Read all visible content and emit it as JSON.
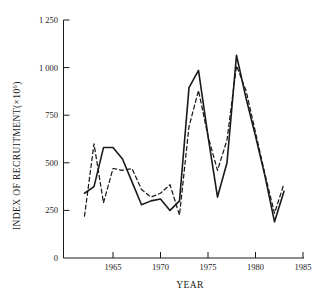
{
  "chart_data": {
    "type": "line",
    "title": "",
    "xlabel": "YEAR",
    "ylabel": "INDEX OF RECRUITMENT(×10",
    "ylabel_sup": "6",
    "ylabel_close": ")",
    "xlim": [
      1961.5,
      1985.0
    ],
    "ylim": [
      0,
      1250
    ],
    "xticks": [
      1965,
      1970,
      1975,
      1980,
      1985
    ],
    "xtick_labels": [
      "1965",
      "1970",
      "1975",
      "1980",
      "1985"
    ],
    "yticks": [
      0,
      250,
      500,
      750,
      1000,
      1250
    ],
    "ytick_labels": [
      "0",
      "250",
      "500",
      "750",
      "1 000",
      "1 250"
    ],
    "grid": false,
    "legend": "none",
    "series": [
      {
        "name": "solid-series",
        "style": "solid",
        "color": "#1a1a1a",
        "x": [
          1962,
          1963,
          1964,
          1965,
          1966,
          1967,
          1968,
          1969,
          1970,
          1971,
          1972,
          1973,
          1974,
          1975,
          1976,
          1977,
          1978,
          1979,
          1980,
          1981,
          1982,
          1983
        ],
        "values": [
          340,
          375,
          580,
          580,
          520,
          400,
          280,
          300,
          310,
          250,
          300,
          895,
          985,
          640,
          320,
          500,
          1065,
          840,
          640,
          430,
          190,
          350
        ]
      },
      {
        "name": "dashed-series",
        "style": "dashed",
        "color": "#1a1a1a",
        "x": [
          1962,
          1963,
          1964,
          1965,
          1966,
          1967,
          1968,
          1969,
          1970,
          1971,
          1972,
          1973,
          1974,
          1975,
          1976,
          1977,
          1978,
          1979,
          1980,
          1981,
          1982,
          1983
        ],
        "values": [
          220,
          600,
          290,
          470,
          460,
          470,
          360,
          320,
          340,
          385,
          225,
          690,
          880,
          640,
          460,
          620,
          1010,
          880,
          660,
          440,
          235,
          390
        ]
      }
    ]
  }
}
